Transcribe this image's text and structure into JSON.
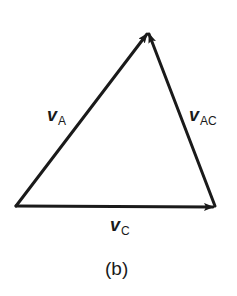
{
  "figure": {
    "caption": "(b)",
    "stroke_color": "#1a1a1a",
    "background": "#ffffff"
  },
  "vertices": {
    "bottom_left": [
      16,
      206
    ],
    "apex": [
      148,
      32
    ],
    "bottom_right": [
      215,
      206
    ]
  },
  "vectors": [
    {
      "id": "vA",
      "symbol": "v",
      "subscript": "A",
      "from": "bottom_left",
      "to": "apex"
    },
    {
      "id": "vAC",
      "symbol": "v",
      "subscript": "AC",
      "from": "bottom_right",
      "to": "apex"
    },
    {
      "id": "vC",
      "symbol": "v",
      "subscript": "C",
      "from": "bottom_left",
      "to": "bottom_right"
    }
  ]
}
